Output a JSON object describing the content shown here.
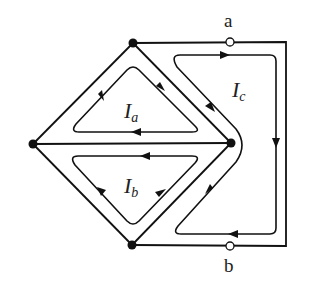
{
  "diagram": {
    "type": "circuit-mesh-currents",
    "nodes": [
      {
        "id": "top",
        "x": 133,
        "y": 43
      },
      {
        "id": "left",
        "x": 33,
        "y": 144
      },
      {
        "id": "right",
        "x": 231,
        "y": 143
      },
      {
        "id": "bottom",
        "x": 132,
        "y": 245
      }
    ],
    "terminals": [
      {
        "id": "a",
        "label": "a",
        "x": 230,
        "y": 42
      },
      {
        "id": "b",
        "label": "b",
        "x": 230,
        "y": 246
      }
    ],
    "loops": [
      {
        "id": "Ia",
        "label": "I",
        "subscript": "a",
        "direction": "clockwise"
      },
      {
        "id": "Ib",
        "label": "I",
        "subscript": "b",
        "direction": "counterclockwise"
      },
      {
        "id": "Ic",
        "label": "I",
        "subscript": "c",
        "direction": "clockwise"
      }
    ],
    "labels": {
      "terminal_a": "a",
      "terminal_b": "b",
      "Ia_main": "I",
      "Ia_sub": "a",
      "Ib_main": "I",
      "Ib_sub": "b",
      "Ic_main": "I",
      "Ic_sub": "c"
    },
    "colors": {
      "line": "#111111",
      "background": "#ffffff"
    }
  }
}
